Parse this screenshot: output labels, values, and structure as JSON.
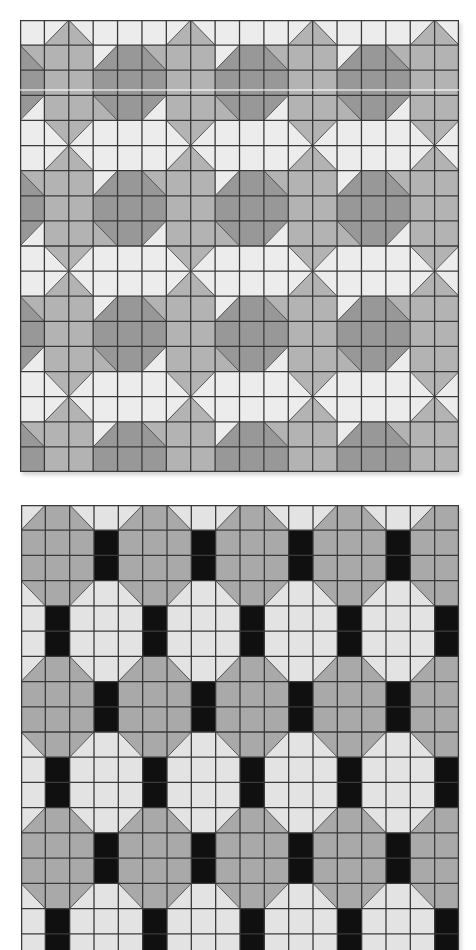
{
  "panels": [
    {
      "id": "top",
      "name": "octagon-plus-tile-pattern",
      "cols": 18,
      "rows": 18,
      "x": 20,
      "y": 20,
      "width": 439,
      "height": 452,
      "grid_line_color": "#3a3a3a",
      "colors": {
        "W": "#efefef",
        "M": "#b6b6b6",
        "D": "#9a9a9a"
      },
      "period": {
        "cols": 5,
        "rows": 5
      },
      "unit": [
        [
          "W",
          "tl:W|br:M",
          "tr:W|bl:M",
          "W",
          "W"
        ],
        [
          "tr:M|bl:D",
          "M",
          "M",
          "tl:W|br:D",
          "D"
        ],
        [
          "D",
          "M",
          "M",
          "D",
          "D"
        ],
        [
          "tl:D|br:W",
          "M",
          "M",
          "tr:D|bl:M",
          "D"
        ],
        [
          "W",
          "tr:M|bl:W",
          "tl:M|br:W",
          "W",
          "W"
        ]
      ]
    },
    {
      "id": "bottom",
      "name": "octagon-black-bar-tile-pattern",
      "cols": 18,
      "rows": 18,
      "x": 21,
      "y": 505,
      "width": 438,
      "height": 454,
      "grid_line_color": "#3a3a3a",
      "colors": {
        "L": "#e6e6e6",
        "G": "#acacac",
        "K": "#111111"
      },
      "period": {
        "cols": 4,
        "rows": 6
      },
      "unit": [
        [
          "tl:L|br:G",
          "G",
          "tr:L|bl:G",
          "L"
        ],
        [
          "G",
          "G",
          "G",
          "K"
        ],
        [
          "G",
          "G",
          "G",
          "K"
        ],
        [
          "tr:G|bl:L",
          "G",
          "tl:G|br:L",
          "L"
        ],
        [
          "L",
          "K",
          "L",
          "L"
        ],
        [
          "L",
          "K",
          "L",
          "L"
        ]
      ]
    }
  ]
}
